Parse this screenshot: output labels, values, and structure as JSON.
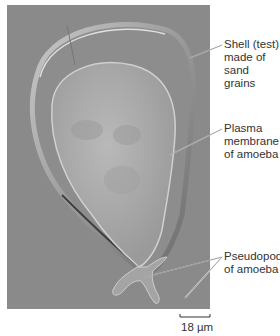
{
  "figure": {
    "image_description": "Light micrograph (DIC) of a testate amoeba inside its shell",
    "labels": [
      {
        "id": "shell",
        "lines": [
          "Shell (test)",
          "made of",
          "sand grains"
        ]
      },
      {
        "id": "plasma-membrane",
        "lines": [
          "Plasma",
          "membrane",
          "of amoeba"
        ]
      },
      {
        "id": "pseudopods",
        "lines": [
          "Pseudopods",
          "of amoeba"
        ]
      }
    ],
    "scale_bar": {
      "label": "18 µm"
    }
  },
  "colors": {
    "background": "#8a8a8a",
    "text": "#333333",
    "leader_line": "#ffffff"
  }
}
